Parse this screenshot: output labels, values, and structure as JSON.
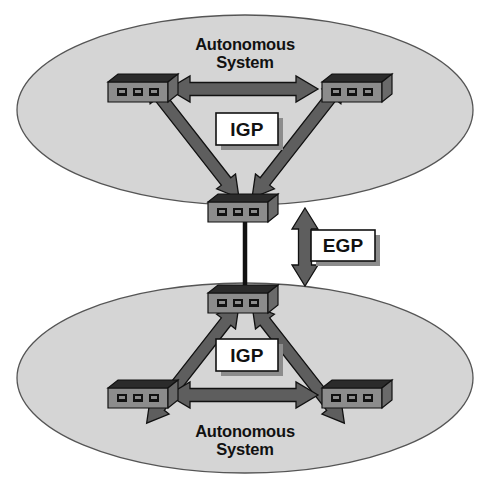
{
  "diagram": {
    "canvas": {
      "width": 491,
      "height": 489,
      "background": "#ffffff"
    },
    "colors": {
      "ellipse_fill": "#d5d5d5",
      "ellipse_stroke": "#555555",
      "arrow_fill": "#5e5e5e",
      "arrow_stroke": "#111111",
      "router_top": "#2b2b2b",
      "router_front": "#8c8c8c",
      "router_side": "#6a6a6a",
      "router_stroke": "#111111",
      "port_fill": "#111111",
      "label_box_fill": "#ffffff",
      "label_box_stroke": "#111111",
      "label_box_shadow": "#8c8c8c",
      "link_line": "#111111",
      "text": "#111111"
    },
    "regions": [
      {
        "id": "as-top",
        "name": "Autonomous System",
        "label_lines": [
          "Autonomous",
          "System"
        ],
        "label_position": "top",
        "ellipse": {
          "cx": 245,
          "cy": 110,
          "rx": 228,
          "ry": 95
        }
      },
      {
        "id": "as-bottom",
        "name": "Autonomous System",
        "label_lines": [
          "Autonomous",
          "System"
        ],
        "label_position": "bottom",
        "ellipse": {
          "cx": 245,
          "cy": 378,
          "rx": 228,
          "ry": 95
        }
      }
    ],
    "routers": [
      {
        "id": "r-top-left",
        "region": "as-top",
        "ports": 3,
        "x": 108,
        "y": 72
      },
      {
        "id": "r-top-right",
        "region": "as-top",
        "ports": 3,
        "x": 322,
        "y": 72
      },
      {
        "id": "r-top-border",
        "region": "as-top",
        "ports": 3,
        "x": 208,
        "y": 192
      },
      {
        "id": "r-bot-border",
        "region": "as-bottom",
        "ports": 3,
        "x": 208,
        "y": 283
      },
      {
        "id": "r-bot-left",
        "region": "as-bottom",
        "ports": 3,
        "x": 108,
        "y": 378
      },
      {
        "id": "r-bot-right",
        "region": "as-bottom",
        "ports": 3,
        "x": 322,
        "y": 378
      }
    ],
    "links": [
      {
        "id": "igp-top-horizontal",
        "protocol": "IGP",
        "style": "double-arrow",
        "from": "r-top-left",
        "to": "r-top-right"
      },
      {
        "id": "igp-top-left-diag",
        "protocol": "IGP",
        "style": "double-arrow",
        "from": "r-top-border",
        "to": "r-top-left"
      },
      {
        "id": "igp-top-right-diag",
        "protocol": "IGP",
        "style": "double-arrow",
        "from": "r-top-border",
        "to": "r-top-right"
      },
      {
        "id": "egp-interconnect",
        "protocol": "EGP",
        "style": "plain-line",
        "from": "r-top-border",
        "to": "r-bot-border"
      },
      {
        "id": "igp-bot-left-diag",
        "protocol": "IGP",
        "style": "double-arrow",
        "from": "r-bot-border",
        "to": "r-bot-left"
      },
      {
        "id": "igp-bot-right-diag",
        "protocol": "IGP",
        "style": "double-arrow",
        "from": "r-bot-border",
        "to": "r-bot-right"
      },
      {
        "id": "igp-bot-horizontal",
        "protocol": "IGP",
        "style": "double-arrow",
        "from": "r-bot-left",
        "to": "r-bot-right"
      }
    ],
    "callouts": [
      {
        "id": "igp-top",
        "text": "IGP",
        "x": 216,
        "y": 113,
        "w": 62,
        "h": 32
      },
      {
        "id": "egp-middle",
        "text": "EGP",
        "x": 311,
        "y": 230,
        "w": 64,
        "h": 31
      },
      {
        "id": "igp-bottom",
        "text": "IGP",
        "x": 216,
        "y": 339,
        "w": 62,
        "h": 32
      }
    ],
    "markers": [
      {
        "id": "egp-vertical-double-arrow",
        "kind": "double-arrow-vertical",
        "x": 292,
        "top": 208,
        "bottom": 286
      }
    ]
  }
}
